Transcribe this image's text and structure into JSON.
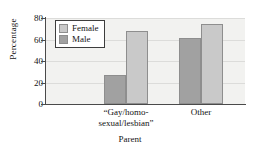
{
  "chart_data": {
    "type": "bar",
    "title": "",
    "xlabel": "Parent",
    "ylabel": "Percentage",
    "categories": [
      "“Gay/homo-sexual/lesbian”",
      "Other"
    ],
    "category_lines": [
      [
        "“Gay/homo-",
        "sexual/lesbian”"
      ],
      [
        "Other"
      ]
    ],
    "series": [
      {
        "name": "Male",
        "values": [
          27,
          61
        ],
        "color": "#a1a1a1"
      },
      {
        "name": "Female",
        "values": [
          68,
          74
        ],
        "color": "#c9c9c9"
      }
    ],
    "legend": {
      "position": "top-left",
      "entries": [
        "Female",
        "Male"
      ]
    },
    "ylim": [
      0,
      80
    ],
    "yticks": [
      0,
      20,
      40,
      60,
      80
    ],
    "ytick_labels": [
      "0",
      "20",
      "40",
      "60",
      "80"
    ],
    "grid": true,
    "grid_axis": "y",
    "bar_order_in_group": [
      "Male",
      "Female"
    ],
    "plot_background": "#f2f2f0",
    "axis_color": "#4a4a4a"
  }
}
